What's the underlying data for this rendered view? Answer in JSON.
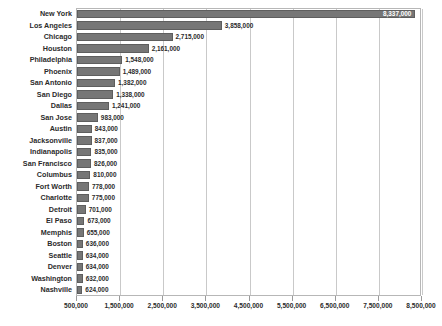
{
  "chart_data": {
    "type": "bar",
    "orientation": "horizontal",
    "title": "",
    "subtitle": "",
    "xlabel": "",
    "ylabel": "",
    "xlim": [
      500000,
      8500000
    ],
    "xticks": [
      "500,000",
      "1,500,000",
      "2,500,000",
      "3,500,000",
      "4,500,000",
      "5,500,000",
      "6,500,000",
      "7,500,000",
      "8,500,000"
    ],
    "xtick_values": [
      500000,
      1500000,
      2500000,
      3500000,
      4500000,
      5500000,
      6500000,
      7500000,
      8500000
    ],
    "grid": "vertical",
    "legend": "none",
    "bar_color": "#767676",
    "categories": [
      "New York",
      "Los Angeles",
      "Chicago",
      "Houston",
      "Philadelphia",
      "Phoenix",
      "San Antonio",
      "San Diego",
      "Dallas",
      "San Jose",
      "Austin",
      "Jacksonville",
      "Indianapolis",
      "San Francisco",
      "Columbus",
      "Fort Worth",
      "Charlotte",
      "Detroit",
      "El Paso",
      "Memphis",
      "Boston",
      "Seattle",
      "Denver",
      "Washington",
      "Nashville"
    ],
    "values": [
      8337000,
      3858000,
      2715000,
      2161000,
      1548000,
      1489000,
      1382000,
      1338000,
      1241000,
      983000,
      843000,
      837000,
      835000,
      826000,
      810000,
      778000,
      775000,
      701000,
      673000,
      655000,
      636000,
      634000,
      634000,
      632000,
      624000
    ],
    "data_labels": [
      "8,337,000",
      "3,858,000",
      "2,715,000",
      "2,161,000",
      "1,548,000",
      "1,489,000",
      "1,382,000",
      "1,338,000",
      "1,241,000",
      "983,000",
      "843,000",
      "837,000",
      "835,000",
      "826,000",
      "810,000",
      "778,000",
      "775,000",
      "701,000",
      "673,000",
      "655,000",
      "636,000",
      "634,000",
      "634,000",
      "632,000",
      "624,000"
    ]
  }
}
